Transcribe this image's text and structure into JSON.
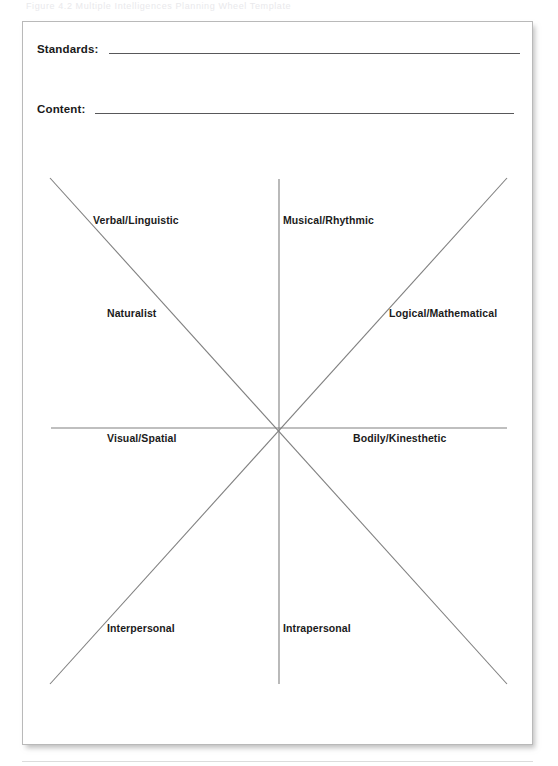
{
  "page": {
    "scan_header_text": "Figure 4.2  Multiple Intelligences Planning Wheel Template",
    "background_color": "#ffffff",
    "card_border_color": "#b9b9b9",
    "line_color": "#808080",
    "rule_color": "#58585a"
  },
  "form": {
    "fields": [
      {
        "label": "Standards:",
        "value": ""
      },
      {
        "label": "Content:",
        "value": ""
      }
    ]
  },
  "wheel": {
    "center": {
      "x": 256,
      "y": 406
    },
    "axes": [
      {
        "name": "horizontal",
        "x1": 28,
        "y1": 406,
        "x2": 484,
        "y2": 406
      },
      {
        "name": "vertical",
        "x1": 256,
        "y1": 157,
        "x2": 256,
        "y2": 662
      },
      {
        "name": "diagonal-nw-se",
        "x1": 27,
        "y1": 156,
        "x2": 484,
        "y2": 662
      },
      {
        "name": "diagonal-ne-sw",
        "x1": 484,
        "y1": 156,
        "x2": 27,
        "y2": 662
      }
    ],
    "labels": [
      {
        "id": "verbal",
        "text": "Verbal/Linguistic",
        "quadrant": "upper-left"
      },
      {
        "id": "musical",
        "text": "Musical/Rhythmic",
        "quadrant": "upper-right"
      },
      {
        "id": "naturalist",
        "text": "Naturalist",
        "quadrant": "upper-left-lower"
      },
      {
        "id": "logical",
        "text": "Logical/Mathematical",
        "quadrant": "upper-right-lower"
      },
      {
        "id": "visual",
        "text": "Visual/Spatial",
        "quadrant": "middle-left"
      },
      {
        "id": "bodily",
        "text": "Bodily/Kinesthetic",
        "quadrant": "middle-right"
      },
      {
        "id": "interpersonal",
        "text": "Interpersonal",
        "quadrant": "lower-left"
      },
      {
        "id": "intrapersonal",
        "text": "Intrapersonal",
        "quadrant": "lower-right"
      }
    ]
  }
}
